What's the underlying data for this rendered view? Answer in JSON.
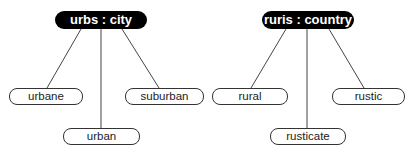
{
  "trees": [
    {
      "root": {
        "label": "urbs : city"
      },
      "children": [
        {
          "label": "urbane"
        },
        {
          "label": "urban"
        },
        {
          "label": "suburban"
        }
      ]
    },
    {
      "root": {
        "label": "ruris : country"
      },
      "children": [
        {
          "label": "rural"
        },
        {
          "label": "rusticate"
        },
        {
          "label": "rustic"
        }
      ]
    }
  ],
  "colors": {
    "root_fill": "#000000",
    "root_text": "#ffffff",
    "leaf_border": "#333333",
    "link_line": "#444444"
  }
}
